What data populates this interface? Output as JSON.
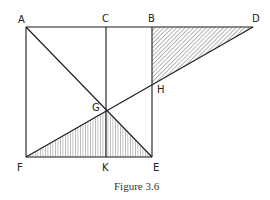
{
  "figure": {
    "caption": "Figure 3.6",
    "points": {
      "A": {
        "label": "A",
        "x": 26,
        "y": 27
      },
      "C": {
        "label": "C",
        "x": 106,
        "y": 27
      },
      "B": {
        "label": "B",
        "x": 152,
        "y": 27
      },
      "D": {
        "label": "D",
        "x": 253,
        "y": 27
      },
      "F": {
        "label": "F",
        "x": 26,
        "y": 157
      },
      "K": {
        "label": "K",
        "x": 106,
        "y": 157
      },
      "E": {
        "label": "E",
        "x": 152,
        "y": 157
      },
      "G": {
        "label": "G",
        "x": 106,
        "y": 111
      },
      "H": {
        "label": "H",
        "x": 152,
        "y": 84
      }
    },
    "shaded_regions": [
      {
        "name": "triangle-BDH",
        "vertices": [
          "B",
          "D",
          "H"
        ],
        "hatch": "diagonal"
      },
      {
        "name": "triangle-FGE",
        "vertices": [
          "F",
          "G",
          "E"
        ],
        "hatch": "vertical"
      }
    ],
    "line_color": "#1a1a1a"
  }
}
